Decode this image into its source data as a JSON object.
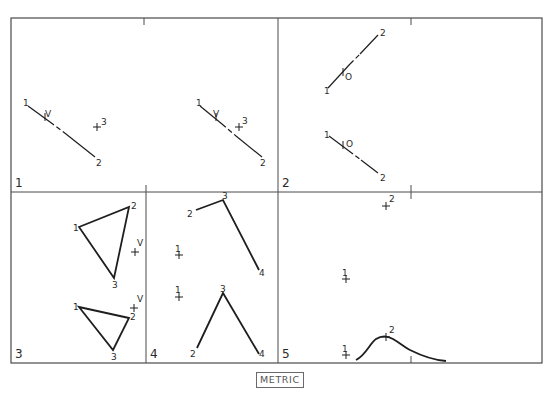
{
  "sheet": {
    "frame": {
      "x": 11,
      "y": 18,
      "w": 531,
      "h": 345
    },
    "dividers": {
      "horizontal_y": 192,
      "top_vertical_x": 278,
      "bottom_left_vertical_x": 146,
      "bottom_right_vertical_x": 278
    },
    "unit_label": "METRIC"
  },
  "panels": [
    {
      "id": "1",
      "label": "1",
      "label_pos": [
        15,
        187
      ],
      "views": [
        {
          "name": "left-view",
          "line": {
            "from": [
              28,
              106
            ],
            "to": [
              95,
              157
            ],
            "dashed_segment": [
              [
                50,
                122
              ],
              [
                66,
                134
              ]
            ]
          },
          "points": [
            {
              "label": "1",
              "pos": [
                23,
                106
              ]
            },
            {
              "label": "V",
              "pos": [
                45,
                117
              ],
              "marker": "tick",
              "at": [
                45,
                117
              ]
            },
            {
              "label": "2",
              "pos": [
                96,
                166
              ]
            },
            {
              "label": "3",
              "pos": [
                101,
                125
              ],
              "marker": "cross",
              "at": [
                97,
                127
              ]
            }
          ]
        },
        {
          "name": "right-view",
          "line": {
            "from": [
              200,
              106
            ],
            "to": [
              262,
              157
            ],
            "dashed_segment": [
              [
                222,
                124
              ],
              [
                236,
                136
              ]
            ]
          },
          "points": [
            {
              "label": "1",
              "pos": [
                196,
                106
              ]
            },
            {
              "label": "V",
              "pos": [
                213,
                117
              ],
              "marker": "tick",
              "at": [
                216,
                117
              ]
            },
            {
              "label": "2",
              "pos": [
                260,
                166
              ]
            },
            {
              "label": "3",
              "pos": [
                242,
                124
              ],
              "marker": "cross",
              "at": [
                239,
                127
              ]
            }
          ]
        }
      ]
    },
    {
      "id": "2",
      "label": "2",
      "label_pos": [
        282,
        187
      ],
      "views": [
        {
          "name": "top-view",
          "line": {
            "from": [
              328,
              88
            ],
            "to": [
              378,
              35
            ],
            "dashed_segment": [
              [
                350,
                64
              ],
              [
                360,
                54
              ]
            ]
          },
          "points": [
            {
              "label": "1",
              "pos": [
                324,
                94
              ]
            },
            {
              "label": "O",
              "pos": [
                345,
                80
              ],
              "marker": "tick",
              "at": [
                343,
                72
              ]
            },
            {
              "label": "2",
              "pos": [
                380,
                36
              ]
            }
          ]
        },
        {
          "name": "bottom-view",
          "line": {
            "from": [
              329,
              136
            ],
            "to": [
              378,
              173
            ],
            "dashed_segment": [
              [
                349,
                151
              ],
              [
                361,
                160
              ]
            ]
          },
          "points": [
            {
              "label": "1",
              "pos": [
                324,
                138
              ]
            },
            {
              "label": "O",
              "pos": [
                346,
                147
              ],
              "marker": "tick",
              "at": [
                343,
                145
              ]
            },
            {
              "label": "2",
              "pos": [
                380,
                181
              ]
            }
          ]
        }
      ]
    },
    {
      "id": "3",
      "label": "3",
      "label_pos": [
        15,
        358
      ],
      "views": [
        {
          "name": "upper-triangle",
          "triangle": [
            [
              79,
              227
            ],
            [
              129,
              207
            ],
            [
              114,
              278
            ]
          ],
          "points": [
            {
              "label": "1",
              "pos": [
                73,
                231
              ]
            },
            {
              "label": "2",
              "pos": [
                131,
                209
              ]
            },
            {
              "label": "3",
              "pos": [
                112,
                288
              ]
            },
            {
              "label": "V",
              "pos": [
                137,
                246
              ],
              "marker": "cross",
              "at": [
                135,
                252
              ]
            }
          ]
        },
        {
          "name": "lower-triangle",
          "triangle": [
            [
              79,
              307
            ],
            [
              129,
              318
            ],
            [
              113,
              350
            ]
          ],
          "points": [
            {
              "label": "1",
              "pos": [
                73,
                310
              ]
            },
            {
              "label": "2",
              "pos": [
                130,
                320
              ]
            },
            {
              "label": "3",
              "pos": [
                111,
                360
              ]
            },
            {
              "label": "V",
              "pos": [
                137,
                302
              ],
              "marker": "cross",
              "at": [
                134,
                308
              ]
            }
          ]
        }
      ]
    },
    {
      "id": "4",
      "label": "4",
      "label_pos": [
        150,
        358
      ],
      "views": [
        {
          "name": "upper-polyline",
          "polyline": [
            [
              196,
              210
            ],
            [
              223,
              200
            ],
            [
              259,
              270
            ]
          ],
          "points": [
            {
              "label": "2",
              "pos": [
                187,
                217
              ]
            },
            {
              "label": "3",
              "pos": [
                222,
                199
              ]
            },
            {
              "label": "4",
              "pos": [
                259,
                276
              ]
            },
            {
              "label": "1",
              "pos": [
                175,
                252
              ],
              "marker": "cross",
              "at": [
                179,
                255
              ]
            }
          ]
        },
        {
          "name": "lower-polyline",
          "polyline": [
            [
              197,
              348
            ],
            [
              223,
              293
            ],
            [
              259,
              354
            ]
          ],
          "points": [
            {
              "label": "2",
              "pos": [
                190,
                357
              ]
            },
            {
              "label": "3",
              "pos": [
                220,
                292
              ]
            },
            {
              "label": "4",
              "pos": [
                259,
                357
              ]
            },
            {
              "label": "1",
              "pos": [
                175,
                293
              ],
              "marker": "cross",
              "at": [
                179,
                297
              ]
            }
          ]
        }
      ]
    },
    {
      "id": "5",
      "label": "5",
      "label_pos": [
        282,
        358
      ],
      "views": [
        {
          "name": "upper-points",
          "points": [
            {
              "label": "2",
              "pos": [
                389,
                202
              ],
              "marker": "cross",
              "at": [
                386,
                206
              ]
            },
            {
              "label": "1",
              "pos": [
                342,
                276
              ],
              "marker": "cross",
              "at": [
                346,
                279
              ]
            }
          ]
        },
        {
          "name": "profile-curve",
          "curve": "M356,360 C366,355 370,343 376,339 C382,335 388,336 393,339 C400,343 404,347 410,350 C420,355 432,360 446,361",
          "points": [
            {
              "label": "2",
              "pos": [
                389,
                333
              ],
              "marker": "cross",
              "at": [
                386,
                337
              ]
            },
            {
              "label": "1",
              "pos": [
                342,
                352
              ],
              "marker": "cross",
              "at": [
                346,
                355
              ]
            }
          ]
        }
      ]
    }
  ],
  "frame_ticks": [
    {
      "x": 144,
      "y1": 18,
      "y2": 25
    },
    {
      "x": 411,
      "y1": 18,
      "y2": 25
    },
    {
      "x": 146,
      "y1": 185,
      "y2": 192
    },
    {
      "x": 411,
      "y1": 185,
      "y2": 199
    },
    {
      "x": 411,
      "y1": 356,
      "y2": 363
    }
  ]
}
